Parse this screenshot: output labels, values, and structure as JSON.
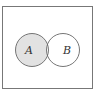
{
  "diagram": {
    "type": "venn",
    "title": "",
    "sets": [
      {
        "label": "A",
        "shaded": "only"
      },
      {
        "label": "B",
        "shaded": "none"
      }
    ],
    "shaded_region": "A minus B",
    "colors": {
      "shade": "#e2e2e2",
      "stroke": "#666666",
      "background": "#ffffff"
    }
  }
}
